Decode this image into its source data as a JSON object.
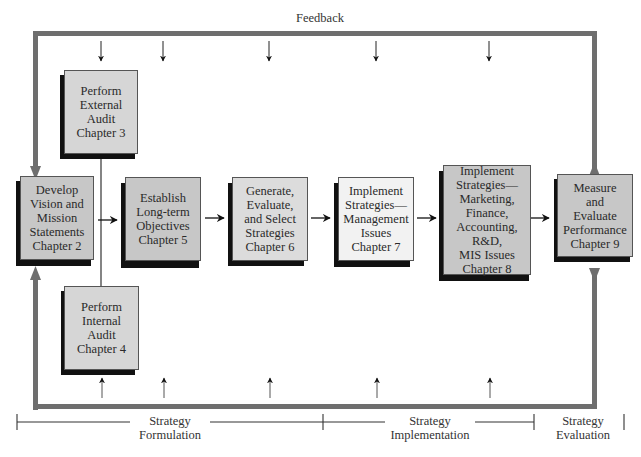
{
  "diagram": {
    "title": "Feedback",
    "colors": {
      "frame": "#6e6e6e",
      "box_dark": "#c4c4c4",
      "box_light": "#dcdcdc",
      "box_lightest": "#f0f0f0",
      "shadow": "#111111"
    },
    "boxes": [
      {
        "id": "external-audit",
        "text": "Perform\nExternal\nAudit\nChapter 3"
      },
      {
        "id": "vision-mission",
        "text": "Develop\nVision and\nMission\nStatements\nChapter 2"
      },
      {
        "id": "internal-audit",
        "text": "Perform\nInternal\nAudit\nChapter 4"
      },
      {
        "id": "long-term-objectives",
        "text": "Establish\nLong-term\nObjectives\nChapter 5"
      },
      {
        "id": "select-strategies",
        "text": "Generate,\nEvaluate,\nand Select\nStrategies\nChapter 6"
      },
      {
        "id": "implement-management",
        "text": "Implement\nStrategies—\nManagement\nIssues\nChapter 7"
      },
      {
        "id": "implement-marketing",
        "text": "Implement\nStrategies—\nMarketing,\nFinance,\nAccounting, R&D,\nMIS Issues\nChapter 8"
      },
      {
        "id": "measure-evaluate",
        "text": "Measure\nand\nEvaluate\nPerformance\nChapter 9"
      }
    ],
    "phases": [
      {
        "label": "Strategy\nFormulation"
      },
      {
        "label": "Strategy\nImplementation"
      },
      {
        "label": "Strategy\nEvaluation"
      }
    ]
  }
}
